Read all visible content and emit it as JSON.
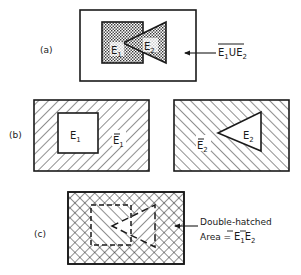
{
  "panel_a": {
    "label": "(a)",
    "set1": "E",
    "set1_sub": "1",
    "set2": "E",
    "set2_sub": "2",
    "annotation": {
      "e1": "E",
      "e1_sub": "1",
      "union": "U",
      "e2": "E",
      "e2_sub": "2",
      "text": "complement of E1 ∪ E2"
    }
  },
  "panel_b": {
    "label": "(b)",
    "left": {
      "inside": "E",
      "inside_sub": "1",
      "outside": "E",
      "outside_sub": "1",
      "outside_text": "complement of E1"
    },
    "right": {
      "inside": "E",
      "inside_sub": "2",
      "outside": "E",
      "outside_sub": "2",
      "outside_text": "complement of E2"
    }
  },
  "panel_c": {
    "label": "(c)",
    "annotation_line1": "Double-hatched",
    "annotation_line2_prefix": "Area = ",
    "e1": "E",
    "e1_sub": "1",
    "e2": "E",
    "e2_sub": "2"
  },
  "colors": {
    "ink": "#1a1a1a",
    "background": "#ffffff"
  }
}
